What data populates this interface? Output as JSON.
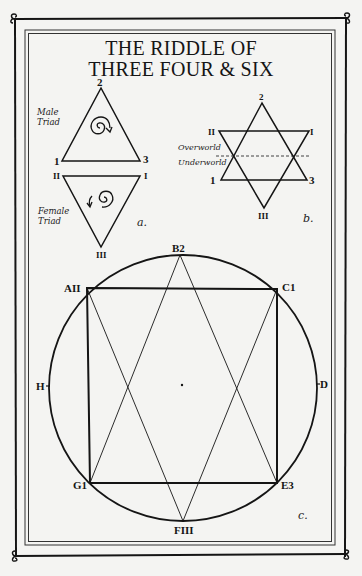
{
  "title": {
    "line1": "THE RIDDLE OF",
    "line2": "THREE FOUR & SIX"
  },
  "panel_a": {
    "caption": "a.",
    "male_triad": {
      "label_line1": "Male",
      "label_line2": "Triad",
      "vertices": {
        "top": "2",
        "bottom_left": "1",
        "bottom_right": "3"
      },
      "spiral_direction": "clockwise"
    },
    "female_triad": {
      "label_line1": "Female",
      "label_line2": "Triad",
      "vertices": {
        "top_left": "II",
        "top_right": "I",
        "bottom": "III"
      },
      "spiral_direction": "counter-clockwise"
    }
  },
  "panel_b": {
    "caption": "b.",
    "vertices": {
      "top": "2",
      "bottom_left": "1",
      "bottom_right": "3",
      "upper_left": "II",
      "upper_right": "I",
      "bottom": "III"
    },
    "overworld_label": "Overworld",
    "underworld_label": "Underworld"
  },
  "panel_c": {
    "caption": "c.",
    "points": {
      "top": "B2",
      "upper_left": "AII",
      "upper_right": "C1",
      "left": "H",
      "right": "D",
      "lower_left": "G1",
      "lower_right": "E3",
      "bottom": "FIII"
    }
  },
  "colors": {
    "paper": "#f4f4f2",
    "ink": "#151515"
  }
}
